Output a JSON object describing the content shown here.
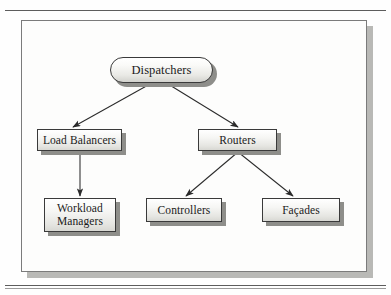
{
  "figure": {
    "type": "hierarchy-diagram",
    "title": "",
    "background_color": "#fdfdfc",
    "frame_color": "#7b7b7b",
    "node_border_color": "#3a3a3a",
    "node_shadow_color": "#8e8e8a",
    "edge_color": "#2b2b2b"
  },
  "nodes": [
    {
      "id": "dispatchers",
      "label": "Dispatchers",
      "shape": "pill",
      "x": 110,
      "y": 57,
      "w": 103,
      "h": 26,
      "font_size": 12.5
    },
    {
      "id": "load-balancers",
      "label": "Load Balancers",
      "shape": "rect",
      "x": 37,
      "y": 129,
      "w": 85,
      "h": 22,
      "font_size": 11.5
    },
    {
      "id": "routers",
      "label": "Routers",
      "shape": "rect",
      "x": 198,
      "y": 129,
      "w": 79,
      "h": 22,
      "font_size": 11.5
    },
    {
      "id": "workload-managers",
      "label": "Workload\nManagers",
      "shape": "rect",
      "x": 44,
      "y": 198,
      "w": 72,
      "h": 34,
      "font_size": 11.5
    },
    {
      "id": "controllers",
      "label": "Controllers",
      "shape": "rect",
      "x": 146,
      "y": 198,
      "w": 76,
      "h": 24,
      "font_size": 11.5
    },
    {
      "id": "facades",
      "label": "Façades",
      "shape": "rect",
      "x": 262,
      "y": 198,
      "w": 78,
      "h": 24,
      "font_size": 11.5
    }
  ],
  "edges": [
    {
      "from": "dispatchers",
      "to": "load-balancers",
      "x1": 150,
      "y1": 84,
      "x2": 73,
      "y2": 127
    },
    {
      "from": "dispatchers",
      "to": "routers",
      "x1": 168,
      "y1": 84,
      "x2": 238,
      "y2": 127
    },
    {
      "from": "load-balancers",
      "to": "workload-managers",
      "x1": 80,
      "y1": 152,
      "x2": 80,
      "y2": 196
    },
    {
      "from": "routers",
      "to": "controllers",
      "x1": 238,
      "y1": 152,
      "x2": 186,
      "y2": 196
    },
    {
      "from": "routers",
      "to": "facades",
      "x1": 238,
      "y1": 152,
      "x2": 293,
      "y2": 196
    }
  ]
}
